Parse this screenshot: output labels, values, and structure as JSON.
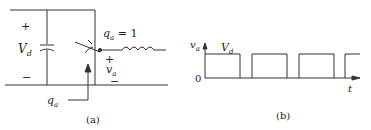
{
  "figure_a": {
    "caption": "(a)",
    "plus_left": "+",
    "minus_left": "−",
    "vd_label": "V",
    "vd_sub": "d",
    "switch_label": "q",
    "switch_sub": "a",
    "switch_eq": " = 1",
    "va_plus": "+",
    "va_label": "v",
    "va_sub": "a",
    "va_minus": "−",
    "qa_label": "q",
    "qa_sub": "a"
  },
  "figure_b": {
    "caption": "(b)",
    "y_label": "v",
    "y_sub": "a",
    "level_label": "V",
    "level_sub": "d",
    "origin_label": "0",
    "x_label": "t"
  },
  "colors": {
    "line": "#333333",
    "background": "#ffffff"
  }
}
